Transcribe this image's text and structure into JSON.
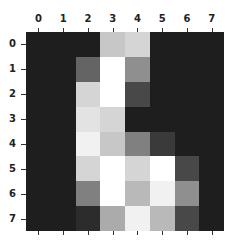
{
  "chart_data": {
    "type": "heatmap",
    "title": "",
    "xlabel": "",
    "ylabel": "",
    "colormap": "gray",
    "vmin": 0,
    "vmax": 16,
    "x_ticks": [
      "0",
      "1",
      "2",
      "3",
      "4",
      "5",
      "6",
      "7"
    ],
    "y_ticks": [
      "0",
      "1",
      "2",
      "3",
      "4",
      "5",
      "6",
      "7"
    ],
    "x_tick_position": "top",
    "values": [
      [
        0,
        0,
        0,
        12,
        13,
        0,
        0,
        0
      ],
      [
        0,
        0,
        5,
        16,
        8,
        0,
        0,
        0
      ],
      [
        0,
        0,
        13,
        16,
        3,
        0,
        0,
        0
      ],
      [
        0,
        0,
        14,
        13,
        0,
        0,
        0,
        0
      ],
      [
        0,
        0,
        15,
        12,
        7,
        2,
        0,
        0
      ],
      [
        0,
        0,
        13,
        16,
        13,
        16,
        3,
        0
      ],
      [
        0,
        0,
        7,
        16,
        11,
        15,
        8,
        0
      ],
      [
        0,
        0,
        1,
        10,
        15,
        11,
        3,
        0
      ]
    ]
  },
  "colors": {
    "low": "#1e1e1e",
    "high": "#ffffff"
  }
}
